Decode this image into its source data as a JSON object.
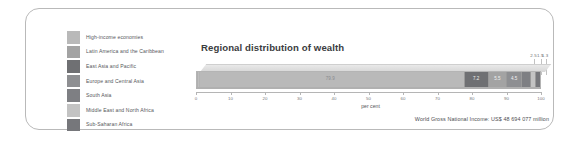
{
  "chart_data": {
    "type": "bar",
    "orientation": "horizontal",
    "stacked": true,
    "title": "Regional distribution of wealth",
    "xlabel": "per cent",
    "ylabel": "",
    "xlim": [
      0,
      100
    ],
    "grid": false,
    "legend_position": "left",
    "tick_labels": [
      "0",
      "10",
      "20",
      "30",
      "40",
      "50",
      "60",
      "70",
      "80",
      "90",
      "100"
    ],
    "tick_values": [
      0,
      10,
      20,
      30,
      40,
      50,
      60,
      70,
      80,
      90,
      100
    ],
    "categories": [
      "High-income economies",
      "Latin America and the Caribbean",
      "East Asia and Pacific",
      "Europe and Central Asia",
      "South Asia",
      "Middle East and North Africa",
      "Sub-Saharan Africa"
    ],
    "values": [
      79.9,
      7.2,
      5.5,
      4.5,
      2.5,
      1.5,
      1.3
    ],
    "colors": [
      "#b9b9b9",
      "#a3a3a3",
      "#6f7073",
      "#8e8f92",
      "#7e7f83",
      "#c3c3c3",
      "#76777b"
    ],
    "annotations": [
      "2.5",
      "1.5",
      "1.3"
    ],
    "footnote": "World Gross National Income: US$ 48 694 077 million"
  },
  "legend": {
    "items": [
      {
        "label": "High-income economies",
        "color": "#b9b9b9"
      },
      {
        "label": "Latin America and the Caribbean",
        "color": "#a3a3a3"
      },
      {
        "label": "East Asia and Pacific",
        "color": "#6f7073"
      },
      {
        "label": "Europe and Central Asia",
        "color": "#8e8f92"
      },
      {
        "label": "South Asia",
        "color": "#7e7f83"
      },
      {
        "label": "Middle East and North Africa",
        "color": "#c3c3c3"
      },
      {
        "label": "Sub-Saharan Africa",
        "color": "#76777b"
      }
    ]
  },
  "bar_segments": [
    {
      "label": "79.9",
      "value": 79.9,
      "color": "#b9b9b9",
      "label_style": "light",
      "show_label": true
    },
    {
      "label": "7.2",
      "value": 7.2,
      "color": "#6f7073",
      "label_style": "dark",
      "show_label": true
    },
    {
      "label": "5.5",
      "value": 5.5,
      "color": "#a3a3a3",
      "label_style": "dark",
      "show_label": true
    },
    {
      "label": "4.5",
      "value": 4.5,
      "color": "#8e8f92",
      "label_style": "dark",
      "show_label": true
    },
    {
      "label": "2.5",
      "value": 2.5,
      "color": "#7e7f83",
      "label_style": "dark",
      "show_label": false
    },
    {
      "label": "1.5",
      "value": 1.5,
      "color": "#c3c3c3",
      "label_style": "dark",
      "show_label": false
    },
    {
      "label": "1.3",
      "value": 1.3,
      "color": "#76777b",
      "label_style": "dark",
      "show_label": false
    }
  ]
}
